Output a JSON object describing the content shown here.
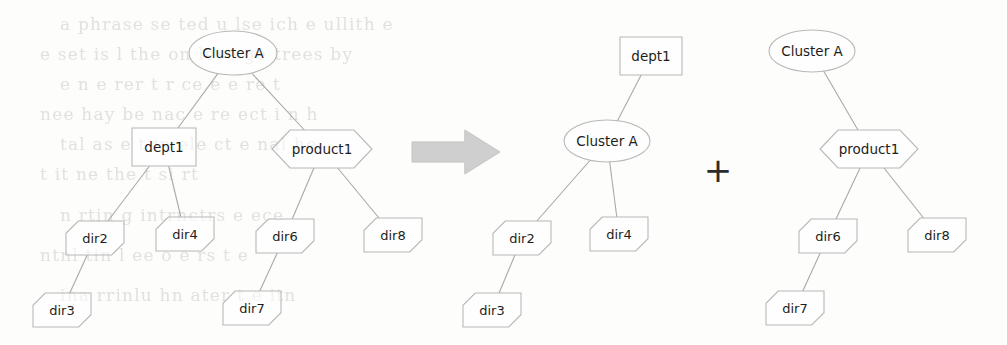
{
  "figure": {
    "operator_symbols": {
      "arrow": "right-block-arrow",
      "plus": "+"
    },
    "background_noise_text": [
      "a phrase se ted u lse ich e ullith e",
      "e set  is l  the  on lese ge trees by",
      "e  n  e  rer t  r  ce  e  e  re  t",
      "nee  hay be  nac e re  ect  i n  h",
      "tal  as  e  t  in  ele  ct  e  nal  he",
      "t  it ne  the  t  si  rt",
      "  n  rtin  g  intrnctrs e   ece",
      "ntnl  tin  l  ee  o e  rs  t  e",
      "ina  rrinlu  hn  ater  t  e  itn"
    ]
  },
  "trees": [
    {
      "id": "tree-before",
      "name": "original-cluster-tree",
      "nodes": [
        {
          "id": "before-cluster-a",
          "label": "Cluster A",
          "shape": "ellipse",
          "cx": 233,
          "cy": 53,
          "rx": 44,
          "ry": 22
        },
        {
          "id": "before-dept1",
          "label": "dept1",
          "shape": "rect",
          "cx": 164,
          "cy": 147,
          "rx": 32,
          "ry": 19
        },
        {
          "id": "before-product1",
          "label": "product1",
          "shape": "hexagon",
          "cx": 322,
          "cy": 149,
          "rx": 50,
          "ry": 19
        },
        {
          "id": "before-dir2",
          "label": "dir2",
          "shape": "cut-corner",
          "cx": 95,
          "cy": 238,
          "rx": 29,
          "ry": 17
        },
        {
          "id": "before-dir4",
          "label": "dir4",
          "shape": "cut-corner",
          "cx": 185,
          "cy": 234,
          "rx": 29,
          "ry": 17
        },
        {
          "id": "before-dir6",
          "label": "dir6",
          "shape": "cut-corner",
          "cx": 285,
          "cy": 236,
          "rx": 29,
          "ry": 17
        },
        {
          "id": "before-dir8",
          "label": "dir8",
          "shape": "cut-corner",
          "cx": 393,
          "cy": 235,
          "rx": 29,
          "ry": 17
        },
        {
          "id": "before-dir3",
          "label": "dir3",
          "shape": "cut-corner",
          "cx": 62,
          "cy": 310,
          "rx": 29,
          "ry": 17
        },
        {
          "id": "before-dir7",
          "label": "dir7",
          "shape": "cut-corner",
          "cx": 252,
          "cy": 308,
          "rx": 29,
          "ry": 17
        }
      ],
      "edges": [
        {
          "from": "before-cluster-a",
          "to": "before-dept1"
        },
        {
          "from": "before-cluster-a",
          "to": "before-product1"
        },
        {
          "from": "before-dept1",
          "to": "before-dir2"
        },
        {
          "from": "before-dept1",
          "to": "before-dir4"
        },
        {
          "from": "before-product1",
          "to": "before-dir6"
        },
        {
          "from": "before-product1",
          "to": "before-dir8"
        },
        {
          "from": "before-dir2",
          "to": "before-dir3"
        },
        {
          "from": "before-dir6",
          "to": "before-dir7"
        }
      ]
    },
    {
      "id": "tree-after-left",
      "name": "dept1-cluster-tree",
      "nodes": [
        {
          "id": "after1-dept1",
          "label": "dept1",
          "shape": "rect",
          "cx": 651,
          "cy": 56,
          "rx": 31,
          "ry": 19
        },
        {
          "id": "after1-cluster-a",
          "label": "Cluster A",
          "shape": "ellipse",
          "cx": 607,
          "cy": 141,
          "rx": 43,
          "ry": 21
        },
        {
          "id": "after1-dir2",
          "label": "dir2",
          "shape": "cut-corner",
          "cx": 522,
          "cy": 238,
          "rx": 29,
          "ry": 17
        },
        {
          "id": "after1-dir4",
          "label": "dir4",
          "shape": "cut-corner",
          "cx": 619,
          "cy": 234,
          "rx": 29,
          "ry": 17
        },
        {
          "id": "after1-dir3",
          "label": "dir3",
          "shape": "cut-corner",
          "cx": 492,
          "cy": 310,
          "rx": 29,
          "ry": 17
        }
      ],
      "edges": [
        {
          "from": "after1-dept1",
          "to": "after1-cluster-a"
        },
        {
          "from": "after1-cluster-a",
          "to": "after1-dir2"
        },
        {
          "from": "after1-cluster-a",
          "to": "after1-dir4"
        },
        {
          "from": "after1-dir2",
          "to": "after1-dir3"
        }
      ]
    },
    {
      "id": "tree-after-right",
      "name": "product1-cluster-tree",
      "nodes": [
        {
          "id": "after2-cluster-a",
          "label": "Cluster A",
          "shape": "ellipse",
          "cx": 812,
          "cy": 51,
          "rx": 43,
          "ry": 21
        },
        {
          "id": "after2-product1",
          "label": "product1",
          "shape": "hexagon",
          "cx": 869,
          "cy": 149,
          "rx": 49,
          "ry": 19
        },
        {
          "id": "after2-dir6",
          "label": "dir6",
          "shape": "cut-corner",
          "cx": 828,
          "cy": 236,
          "rx": 29,
          "ry": 17
        },
        {
          "id": "after2-dir8",
          "label": "dir8",
          "shape": "cut-corner",
          "cx": 937,
          "cy": 235,
          "rx": 29,
          "ry": 17
        },
        {
          "id": "after2-dir7",
          "label": "dir7",
          "shape": "cut-corner",
          "cx": 795,
          "cy": 308,
          "rx": 29,
          "ry": 17
        }
      ],
      "edges": [
        {
          "from": "after2-cluster-a",
          "to": "after2-product1"
        },
        {
          "from": "after2-product1",
          "to": "after2-dir6"
        },
        {
          "from": "after2-product1",
          "to": "after2-dir8"
        },
        {
          "from": "after2-dir6",
          "to": "after2-dir7"
        }
      ]
    }
  ],
  "operators": [
    {
      "id": "transform-arrow",
      "name": "right-block-arrow",
      "x": 412,
      "y": 152,
      "width": 88,
      "height": 44,
      "color": "#cfcfcf"
    },
    {
      "id": "union-plus",
      "name": "plus-sign",
      "symbol": "+",
      "x": 718,
      "y": 172,
      "color": "#2b2b2b"
    }
  ]
}
